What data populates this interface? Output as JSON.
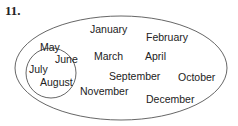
{
  "problem_number": "11.",
  "diagram": {
    "type": "venn",
    "outer_set": {
      "name": "months of the year",
      "members": [
        "January",
        "February",
        "March",
        "April",
        "September",
        "October",
        "November",
        "December"
      ]
    },
    "inner_set": {
      "name": "subset circle",
      "members": [
        "May",
        "June",
        "July",
        "August"
      ]
    },
    "labels": {
      "january": "January",
      "february": "February",
      "march": "March",
      "april": "April",
      "may": "May",
      "june": "June",
      "july": "July",
      "august": "August",
      "september": "September",
      "october": "October",
      "november": "November",
      "december": "December"
    },
    "stroke_color": "#555555"
  }
}
